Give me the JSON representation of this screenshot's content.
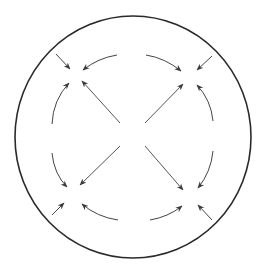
{
  "diagram": {
    "title": "",
    "colors": {
      "background": "#ffffff",
      "outer_circle": "#2a2a2a",
      "arrows": "#4a4a4a"
    },
    "outer_circle": {
      "cx": 133,
      "cy": 137,
      "rx": 118,
      "ry": 121
    },
    "nodes": [
      {
        "name": "top-left",
        "x": 72,
        "y": 72
      },
      {
        "name": "top-right",
        "x": 190,
        "y": 70
      },
      {
        "name": "bottom-left",
        "x": 67,
        "y": 194
      },
      {
        "name": "bottom-right",
        "x": 192,
        "y": 195
      }
    ]
  }
}
